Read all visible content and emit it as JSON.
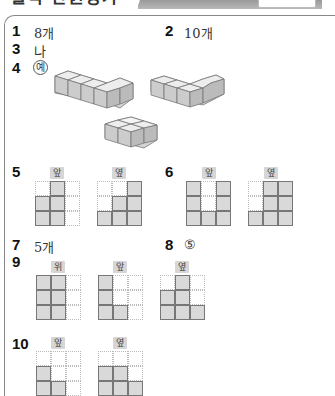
{
  "header": {
    "title": "실력 단원평가"
  },
  "answers": [
    {
      "number": "1",
      "answer": "8개"
    },
    {
      "number": "2",
      "answer": "10개"
    },
    {
      "number": "3",
      "answer": "나"
    },
    {
      "number": "4",
      "answer": "예"
    },
    {
      "number": "5",
      "answer": ""
    },
    {
      "number": "6",
      "answer": ""
    },
    {
      "number": "7",
      "answer": "5개"
    },
    {
      "number": "8",
      "answer": "⑤"
    },
    {
      "number": "9",
      "answer": ""
    },
    {
      "number": "10",
      "answer": ""
    }
  ],
  "views": {
    "front": "앞",
    "side": "옆",
    "top": "위"
  },
  "grids": {
    "p5_front": [
      [
        0,
        1,
        0
      ],
      [
        1,
        1,
        0
      ],
      [
        1,
        1,
        0
      ]
    ],
    "p5_side": [
      [
        0,
        0,
        1
      ],
      [
        0,
        1,
        1
      ],
      [
        1,
        1,
        1
      ]
    ],
    "p6_front": [
      [
        1,
        0,
        1
      ],
      [
        1,
        0,
        1
      ],
      [
        1,
        1,
        1
      ]
    ],
    "p6_side": [
      [
        0,
        1,
        1
      ],
      [
        0,
        1,
        1
      ],
      [
        1,
        1,
        1
      ]
    ],
    "p9_top": [
      [
        1,
        1,
        0
      ],
      [
        1,
        1,
        0
      ],
      [
        1,
        1,
        0
      ]
    ],
    "p9_front": [
      [
        1,
        0,
        0
      ],
      [
        1,
        0,
        0
      ],
      [
        1,
        1,
        0
      ]
    ],
    "p9_side": [
      [
        0,
        1,
        0
      ],
      [
        1,
        1,
        0
      ],
      [
        1,
        1,
        1
      ]
    ],
    "p10_front": [
      [
        0,
        0,
        0
      ],
      [
        1,
        0,
        0
      ],
      [
        1,
        1,
        0
      ]
    ],
    "p10_side": [
      [
        0,
        0,
        0
      ],
      [
        1,
        1,
        0
      ],
      [
        1,
        1,
        1
      ]
    ]
  },
  "colors": {
    "filled_cell": "#d9d9d9",
    "cell_border": "#777777",
    "badge_bg": "#d6d6d6"
  }
}
